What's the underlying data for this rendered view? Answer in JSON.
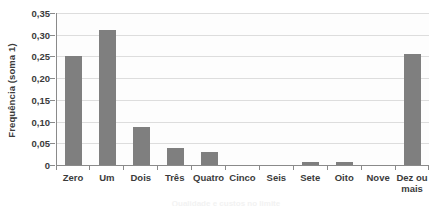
{
  "chart_data": {
    "type": "bar",
    "title": "",
    "subtitle": "",
    "xlabel": "",
    "ylabel": "Frequência (soma 1)",
    "categories": [
      "Zero",
      "Um",
      "Dois",
      "Três",
      "Quatro",
      "Cinco",
      "Seis",
      "Sete",
      "Oito",
      "Nove",
      "Dez ou\nmais"
    ],
    "values": [
      0.25,
      0.31,
      0.088,
      0.04,
      0.029,
      0.0,
      0.0,
      0.007,
      0.008,
      0.0,
      0.256
    ],
    "ylim": [
      0,
      0.35
    ],
    "yticks": [
      0,
      0.05,
      0.1,
      0.15,
      0.2,
      0.25,
      0.3,
      0.35
    ],
    "ytick_labels": [
      "0",
      "0,05",
      "0,10",
      "0,15",
      "0,20",
      "0,25",
      "0,30",
      "0,35"
    ],
    "grid": true,
    "grid_axis": "y",
    "legend": false,
    "legend_position": "none",
    "bar_color": "#7f7f7f",
    "gridline_color": "#dddddd",
    "axis_color": "#8a8a8a",
    "text_color": "#3b3b3b",
    "background_color": "#ffffff",
    "plot_background_color": "#fdfdfd"
  },
  "caption": {
    "text": "Qualidade e custos no limite"
  }
}
